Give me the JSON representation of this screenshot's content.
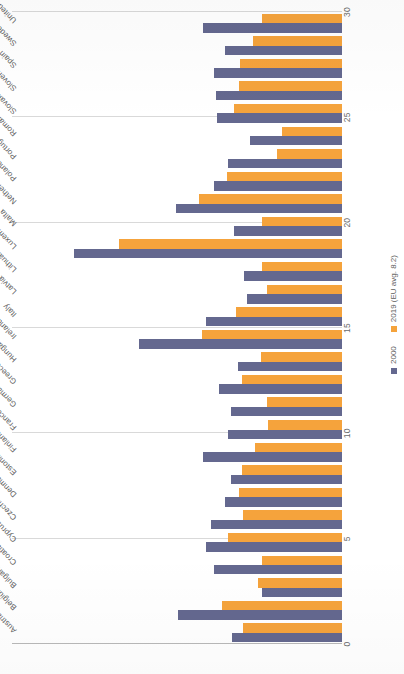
{
  "chart_data": {
    "type": "bar",
    "orientation": "horizontal",
    "title": "",
    "xlabel": "",
    "ylabel": "",
    "grid": true,
    "legend_position": "bottom-left",
    "value_axis": {
      "min": 0,
      "max": 30,
      "ticks": [
        0,
        5,
        10,
        15,
        20,
        25,
        30
      ],
      "tick_labels": [
        "0",
        "5",
        "10",
        "15",
        "20",
        "25",
        "30"
      ]
    },
    "categories": [
      "Austria",
      "Belgium",
      "Bulgaria",
      "Croatia",
      "Cyprus",
      "Czechia",
      "Denmark",
      "Estonia",
      "Finland",
      "France",
      "Germany",
      "Greece",
      "Hungary",
      "Ireland",
      "Italy",
      "Latvia",
      "Lithuania",
      "Luxembourg",
      "Malta",
      "Netherlands",
      "Poland",
      "Portugal",
      "Romania",
      "Slovakia",
      "Slovenia",
      "Spain",
      "Sweden",
      "United Kingdom"
    ],
    "series": [
      {
        "name": "2000",
        "color": "#64688f",
        "values": [
          10.0,
          14.9,
          7.3,
          11.6,
          12.4,
          11.9,
          10.6,
          10.1,
          12.6,
          10.4,
          10.1,
          11.2,
          9.5,
          18.5,
          12.4,
          8.6,
          8.9,
          24.4,
          9.8,
          15.1,
          11.6,
          10.4,
          8.4,
          11.4,
          11.5,
          11.6,
          10.6,
          12.6
        ]
      },
      {
        "name": "2019 (EU avg. 8.2)",
        "color": "#f5a33c",
        "values": [
          9.0,
          10.9,
          7.6,
          7.3,
          10.4,
          9.0,
          9.4,
          9.1,
          7.9,
          6.7,
          6.8,
          9.1,
          7.4,
          12.7,
          9.6,
          6.8,
          7.3,
          20.3,
          7.3,
          13.0,
          10.5,
          5.9,
          5.5,
          9.8,
          9.4,
          9.3,
          8.1,
          7.3
        ]
      }
    ]
  },
  "legend": {
    "items": [
      {
        "label": "2000",
        "color": "#64688f"
      },
      {
        "label": "2019 (EU avg. 8.2)",
        "color": "#f5a33c"
      }
    ]
  },
  "colors": {
    "series_2000": "#64688f",
    "series_2019": "#f5a33c",
    "gridline": "#d9d9d9",
    "axis": "#b9b9b9",
    "text": "#5d5d5d",
    "background": "#ffffff"
  }
}
